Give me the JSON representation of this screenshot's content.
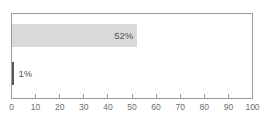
{
  "chart_data": {
    "type": "bar",
    "orientation": "horizontal",
    "title": "",
    "xlabel": "",
    "ylabel": "",
    "xlim": [
      0,
      100
    ],
    "grid": false,
    "legend": null,
    "categories": [
      "",
      ""
    ],
    "values": [
      52,
      1
    ],
    "data_labels": [
      "52%",
      "1%"
    ],
    "series": [
      {
        "name": "",
        "values": [
          52,
          1
        ],
        "labels": [
          "52%",
          "1%"
        ],
        "colors": [
          "#d9d9d9",
          "#595959"
        ]
      }
    ],
    "xticks": [
      0,
      10,
      20,
      30,
      40,
      50,
      60,
      70,
      80,
      90,
      100
    ],
    "xtick_labels": [
      "0",
      "10",
      "20",
      "30",
      "40",
      "50",
      "60",
      "70",
      "80",
      "90",
      "100"
    ]
  },
  "style": {
    "bar_fill_large": "#d9d9d9",
    "bar_fill_small": "#595959",
    "frame_color": "#9b9b9b",
    "axis_color": "#9b9b9b",
    "tick_label_color": "#6d6d6d",
    "data_label_color": "#555555",
    "background": "#ffffff"
  }
}
